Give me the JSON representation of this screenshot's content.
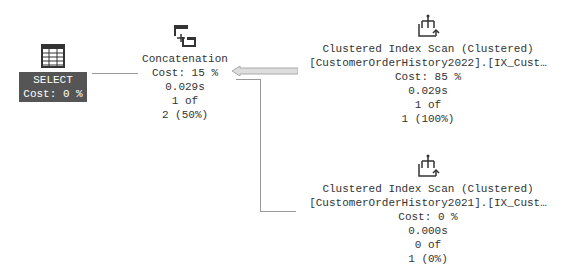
{
  "plan": {
    "select": {
      "label": "SELECT",
      "cost": "Cost: 0 %"
    },
    "concat": {
      "label": "Concatenation",
      "cost": "Cost: 15 %",
      "time": "0.029s",
      "rows1": "1 of",
      "rows2": "2 (50%)"
    },
    "scan1": {
      "label": "Clustered Index Scan (Clustered)",
      "object": "[CustomerOrderHistory2022].[IX_Cust…",
      "cost": "Cost: 85 %",
      "time": "0.029s",
      "rows1": "1 of",
      "rows2": "1 (100%)"
    },
    "scan2": {
      "label": "Clustered Index Scan (Clustered)",
      "object": "[CustomerOrderHistory2021].[IX_Cust…",
      "cost": "Cost: 0 %",
      "time": "0.000s",
      "rows1": "0 of",
      "rows2": "1 (0%)"
    }
  }
}
